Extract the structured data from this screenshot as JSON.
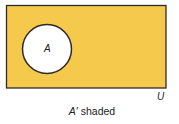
{
  "diagram": {
    "type": "venn",
    "universal_set": {
      "label": "U",
      "fill": "#F5C94C",
      "stroke": "#2b2b2b"
    },
    "sets": [
      {
        "label": "A",
        "fill": "#ffffff",
        "stroke": "#2b2b2b"
      }
    ],
    "shaded_region": "A'",
    "caption": {
      "set": "A′",
      "text": "shaded"
    }
  }
}
